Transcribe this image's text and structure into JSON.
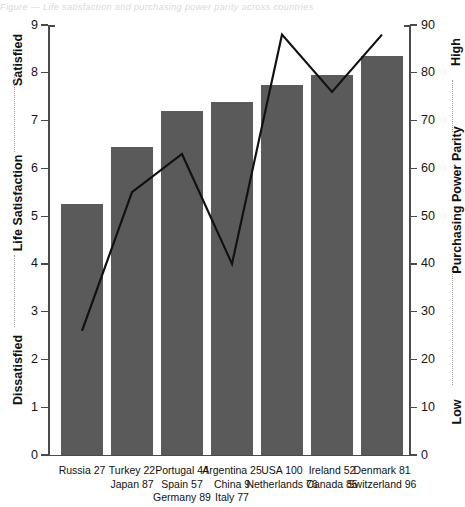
{
  "top_caption": "Figure — Life satisfaction and purchasing power parity across countries",
  "chart_data": {
    "type": "bar",
    "title": "",
    "subtitle": "",
    "xlabel": "",
    "categories": [
      "Russia 27",
      "Turkey 22",
      "Portugal 44",
      "Argentina 25",
      "USA 100",
      "Ireland 52",
      "Denmark 81"
    ],
    "category_lines": [
      [
        "Russia 27"
      ],
      [
        "Turkey 22",
        "Japan 87"
      ],
      [
        "Portugal 44",
        "Spain 57",
        "Germany 89"
      ],
      [
        "Argentina 25",
        "China 9",
        "Italy 77"
      ],
      [
        "USA 100",
        "Netherlands 76"
      ],
      [
        "Ireland 52",
        "Canada 85"
      ],
      [
        "Denmark 81",
        "Switzerland 96"
      ]
    ],
    "series": [
      {
        "name": "Life Satisfaction",
        "type": "bar",
        "axis": "left",
        "color": "#5a5a5a",
        "values": [
          5.25,
          6.45,
          7.2,
          7.38,
          7.75,
          7.95,
          8.35
        ]
      },
      {
        "name": "Purchasing Power Parity",
        "type": "line",
        "axis": "right",
        "color": "#111111",
        "values": [
          26,
          55,
          63,
          40,
          88,
          76,
          88
        ]
      }
    ],
    "left_axis": {
      "label": "Life Satisfaction",
      "label_low": "Dissatisfied",
      "label_high": "Satisfied",
      "ylim": [
        0,
        9
      ],
      "ticks": [
        0,
        1,
        2,
        3,
        4,
        5,
        6,
        7,
        8,
        9
      ],
      "tick_labels": [
        "0",
        "1",
        "2",
        "3",
        "4",
        "5",
        "6",
        "7",
        "8",
        "9"
      ]
    },
    "right_axis": {
      "label": "Purchasing Power Parity",
      "label_low": "Low",
      "label_high": "High",
      "ylim": [
        0,
        90
      ],
      "ticks": [
        0,
        10,
        20,
        30,
        40,
        50,
        60,
        70,
        80,
        90
      ],
      "tick_labels": [
        "0",
        "10",
        "20",
        "30",
        "40",
        "50",
        "60",
        "70",
        "80",
        "90"
      ]
    },
    "grid": false,
    "legend": "none"
  }
}
